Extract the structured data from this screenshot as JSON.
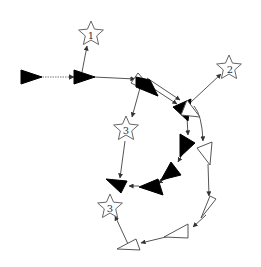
{
  "diagram": {
    "type": "directed-graph",
    "colors": {
      "filled": "#000000",
      "hollow": "#ffffff",
      "edge": "#555555"
    },
    "stars": [
      {
        "id": "s1",
        "label": "1"
      },
      {
        "id": "s2",
        "label": "2"
      },
      {
        "id": "s3a",
        "label": "3"
      },
      {
        "id": "s3b",
        "label": "3"
      }
    ],
    "triangles": [
      {
        "id": "t0",
        "style": "filled"
      },
      {
        "id": "t1",
        "style": "filled"
      },
      {
        "id": "t2",
        "style": "filled-hollow"
      },
      {
        "id": "t3",
        "style": "filled"
      },
      {
        "id": "t4",
        "style": "hollow"
      },
      {
        "id": "t5",
        "style": "filled"
      },
      {
        "id": "t6",
        "style": "hollow"
      },
      {
        "id": "t7",
        "style": "filled"
      },
      {
        "id": "t8",
        "style": "filled"
      },
      {
        "id": "t9",
        "style": "filled"
      },
      {
        "id": "t10",
        "style": "hollow"
      },
      {
        "id": "t11",
        "style": "hollow"
      },
      {
        "id": "t12",
        "style": "hollow"
      }
    ],
    "edges": [
      {
        "from": "t0",
        "to": "t1",
        "style": "dotted"
      },
      {
        "from": "t1",
        "to": "s1",
        "style": "solid"
      },
      {
        "from": "t1",
        "to": "t2",
        "style": "solid"
      },
      {
        "from": "t2",
        "to": "s3a",
        "style": "solid"
      },
      {
        "from": "t2",
        "to": "t3",
        "style": "double"
      },
      {
        "from": "t4",
        "to": "s2",
        "style": "solid"
      },
      {
        "from": "t3",
        "to": "t5",
        "style": "solid"
      },
      {
        "from": "t4",
        "to": "t6",
        "style": "solid"
      },
      {
        "from": "t5",
        "to": "t7",
        "style": "solid"
      },
      {
        "from": "t7",
        "to": "t8",
        "style": "solid"
      },
      {
        "from": "t8",
        "to": "t9",
        "style": "solid"
      },
      {
        "from": "s3a",
        "to": "t9",
        "style": "solid"
      },
      {
        "from": "t6",
        "to": "t10",
        "style": "solid"
      },
      {
        "from": "t10",
        "to": "t11",
        "style": "solid"
      },
      {
        "from": "t11",
        "to": "t12",
        "style": "solid"
      },
      {
        "from": "t12",
        "to": "s3b",
        "style": "solid"
      }
    ]
  }
}
